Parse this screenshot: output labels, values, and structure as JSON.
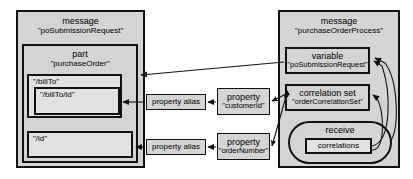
{
  "diagram": {
    "type": "uml-like-nesting-diagram",
    "colors": {
      "container_fill": "#d4d4d4",
      "inner_fill": "#e2e2e2",
      "stroke": "#111111",
      "background": "#ffffff"
    }
  },
  "left_message": {
    "kind": "message",
    "name": "\"poSubmissionRequest\"",
    "part": {
      "kind": "part",
      "name": "\"purchaseOrder\"",
      "fields": [
        {
          "path": "\"/billTo\"",
          "child": {
            "path": "\"/billTo/id\""
          }
        },
        {
          "path": "\"/id\""
        }
      ]
    }
  },
  "aliases": [
    {
      "label": "property alias"
    },
    {
      "label": "property alias"
    }
  ],
  "properties": [
    {
      "kind": "property",
      "name": "\"customerId\""
    },
    {
      "kind": "property",
      "name": "\"orderNumber\""
    }
  ],
  "right_message": {
    "kind": "message",
    "name": "\"purchaseOrderProcess\"",
    "variable": {
      "kind": "variable",
      "name": "\"poSubmissionRequest\""
    },
    "correlation_set": {
      "kind": "correlation set",
      "name": "\"orderCorrelationSet\""
    },
    "receive": {
      "kind": "receive",
      "inner": "correlations"
    }
  }
}
